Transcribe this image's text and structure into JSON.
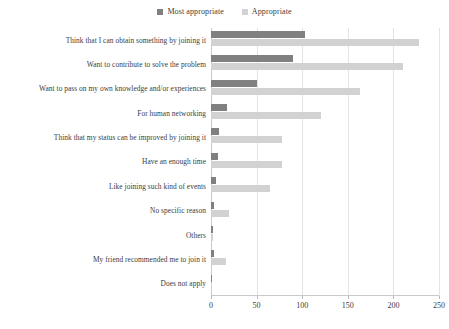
{
  "chart_data": {
    "type": "bar",
    "orientation": "horizontal",
    "title": "",
    "xlabel": "",
    "ylabel": "",
    "xlim": [
      0,
      250
    ],
    "xticks": [
      0,
      50,
      100,
      150,
      200,
      250
    ],
    "grid": true,
    "legend_position": "top-center",
    "categories": [
      "Think that I can obtain something by joining it",
      "Want to contribute to solve the problem",
      "Want to pass on my own knowledge and/or experiences",
      "For human networking",
      "Think that my status can be improved by joining it",
      "Have an enough time",
      "Like joining  such kind of events",
      "No specific reason",
      "Others",
      "My friend recommended me to join it",
      "Does not apply"
    ],
    "series": [
      {
        "name": "Most appropriate",
        "color": "#808080",
        "values": [
          103,
          90,
          50,
          17,
          9,
          8,
          6,
          3,
          2,
          3,
          1
        ]
      },
      {
        "name": "Appropriate",
        "color": "#d2d2d2",
        "values": [
          228,
          210,
          163,
          121,
          78,
          78,
          65,
          20,
          2,
          16,
          1
        ]
      }
    ]
  },
  "legend": {
    "entries": [
      {
        "label": "Most appropriate",
        "color": "#808080"
      },
      {
        "label": "Appropriate",
        "color": "#d2d2d2"
      }
    ]
  },
  "axis": {
    "tick_labels": [
      "0",
      "50",
      "100",
      "150",
      "200",
      "250"
    ]
  },
  "colors": {
    "most_appropriate": "#808080",
    "appropriate": "#d2d2d2",
    "gridline": "#e3e3e3",
    "axis": "#c9c9c9",
    "text": "#3c3c3c",
    "background": "#ffffff"
  }
}
